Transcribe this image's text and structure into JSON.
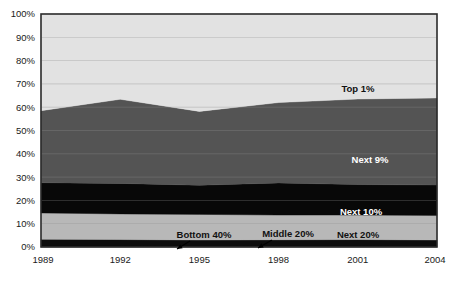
{
  "chart_data": {
    "type": "area",
    "title": "",
    "subtitle": "",
    "xlabel": "",
    "ylabel": "",
    "stacked": true,
    "stack_mode": "percent",
    "grid": true,
    "legend_position": "inline-labels",
    "xlim": [
      1989,
      2004
    ],
    "ylim": [
      0,
      100
    ],
    "x": [
      1989,
      1992,
      1995,
      1998,
      2001,
      2004
    ],
    "x_tick_labels": [
      "1989",
      "1992",
      "1995",
      "1998",
      "2001",
      "2004"
    ],
    "y_ticks": [
      0,
      10,
      20,
      30,
      40,
      50,
      60,
      70,
      80,
      90,
      100
    ],
    "y_tick_labels": [
      "0%",
      "10%",
      "20%",
      "30%",
      "40%",
      "50%",
      "60%",
      "70%",
      "80%",
      "90%",
      "100%"
    ],
    "series": [
      {
        "name": "Bottom 40%",
        "label": "Bottom 40%",
        "color": "#1a1a1a",
        "label_color": "on-light",
        "values": [
          0.3,
          0.3,
          0.2,
          0.3,
          0.3,
          0.2
        ]
      },
      {
        "name": "Middle 20%",
        "label": "Middle 20%",
        "color": "#0d0d0d",
        "label_color": "on-light",
        "values": [
          3.0,
          2.9,
          2.8,
          2.8,
          2.9,
          2.8
        ]
      },
      {
        "name": "Next 20%",
        "label": "Next 20%",
        "color": "#b8b8b8",
        "label_color": "on-light",
        "values": [
          11.3,
          11.0,
          11.0,
          10.6,
          10.5,
          10.5
        ]
      },
      {
        "name": "Next 10%",
        "label": "Next 10%",
        "color": "#080808",
        "label_color": "on-dark",
        "values": [
          13.0,
          13.1,
          12.5,
          13.8,
          13.1,
          13.1
        ]
      },
      {
        "name": "Next 9%",
        "label": "Next 9%",
        "color": "#545454",
        "label_color": "on-dark",
        "values": [
          30.9,
          36.1,
          31.7,
          34.5,
          36.7,
          37.4
        ]
      },
      {
        "name": "Top 1%",
        "label": "Top 1%",
        "color": "#e2e2e2",
        "label_color": "on-light",
        "values": [
          41.5,
          36.6,
          41.8,
          38.0,
          36.5,
          36.0
        ]
      }
    ],
    "callouts": [
      {
        "label": "Bottom 40%",
        "target_series": "Bottom 40%",
        "target_x": 1994.1
      },
      {
        "label": "Middle 20%",
        "target_series": "Middle 20%",
        "target_x": 1997.7
      }
    ],
    "colors": {
      "top_1": "#e2e2e2",
      "next_9": "#545454",
      "next_10": "#080808",
      "next_20": "#b8b8b8",
      "middle_20": "#0d0d0d",
      "bottom_40": "#1a1a1a",
      "frame": "#2b2b2b",
      "text": "#1a1a1a",
      "background": "#ffffff"
    }
  }
}
